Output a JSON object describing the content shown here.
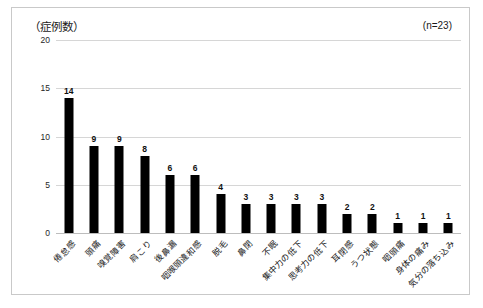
{
  "chart": {
    "axis_title": "（症例数）",
    "sample_size": "(n=23)"
  },
  "chart_data": {
    "type": "bar",
    "title": "（症例数）",
    "subtitle": "",
    "annotation": "(n=23)",
    "xlabel": "",
    "ylabel": "症例数",
    "ylim": [
      0,
      20
    ],
    "yticks": [
      0,
      5,
      10,
      15,
      20
    ],
    "ytick_labels": [
      "0",
      "5",
      "10",
      "15",
      "20"
    ],
    "grid": true,
    "legend": false,
    "bar_color": "#000000",
    "categories": [
      "倦怠感",
      "頭痛",
      "嗅覚障害",
      "肩こり",
      "後鼻漏",
      "咽喉頭違和感",
      "脱毛",
      "鼻閉",
      "不眠",
      "集中力の低下",
      "思考力の低下",
      "耳閉感",
      "うつ状態",
      "咽頭痛",
      "身体の痛み",
      "気分の落ち込み"
    ],
    "values": [
      14,
      9,
      9,
      8,
      6,
      6,
      4,
      3,
      3,
      3,
      3,
      2,
      2,
      1,
      1,
      1
    ],
    "value_labels": [
      "14",
      "9",
      "9",
      "8",
      "6",
      "6",
      "4",
      "3",
      "3",
      "3",
      "3",
      "2",
      "2",
      "1",
      "1",
      "1"
    ]
  }
}
